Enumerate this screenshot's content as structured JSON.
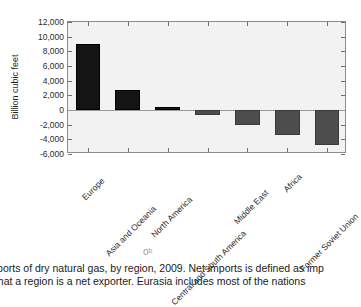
{
  "chart_data": {
    "type": "bar",
    "title": "",
    "xlabel": "",
    "ylabel": "Billion cubic feet",
    "ylim": [
      -6000,
      12000
    ],
    "ytick_values": [
      12000,
      10000,
      8000,
      6000,
      4000,
      2000,
      0,
      -2000,
      -4000,
      -6000
    ],
    "ytick_labels": [
      "12,000",
      "10,000",
      "8,000",
      "6,000",
      "4,000",
      "2,000",
      "0",
      "-2,000",
      "-4,000",
      "-6,000"
    ],
    "grid": false,
    "legend": "none",
    "categories": [
      "Europe",
      "Asia and Oceania",
      "North America",
      "Central and South America",
      "Middle East",
      "Africa",
      "Former Soviet Union"
    ],
    "values": [
      9000,
      2750,
      450,
      -700,
      -2100,
      -3400,
      -4800
    ],
    "colors": {
      "positive_bar": "#151515",
      "negative_bar": "#4d4d4d",
      "plot_background": "#f2f2f2",
      "axis": "#8c8c8c",
      "zero_line": "#9a9a9a"
    }
  },
  "figure": {
    "yaxis_title": "Billion cubic feet",
    "page_artifact": "oᵇ"
  },
  "caption": {
    "line1": "imports of dry natural gas, by region, 2009. Net imports is defined as imp",
    "line2": "tes that a region is a net exporter. Eurasia includes most of the nations"
  }
}
